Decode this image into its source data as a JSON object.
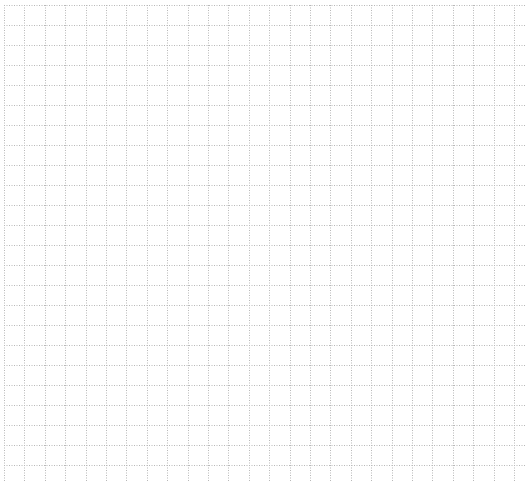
{
  "canvas": {
    "width": 527,
    "height": 486,
    "background": "#ffffff"
  },
  "grid": {
    "line_color": "#b8b8b8",
    "line_style": "dotted",
    "x_start": 4,
    "y_start": 5,
    "spacing_x": 20.4,
    "spacing_y": 20.0,
    "columns": 26,
    "rows": 24,
    "x_end": 525,
    "y_end": 482
  }
}
